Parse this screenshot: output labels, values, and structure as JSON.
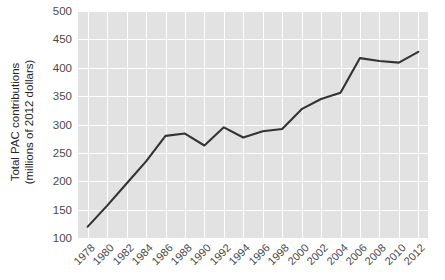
{
  "chart_data": {
    "type": "line",
    "title": "",
    "xlabel": "",
    "ylabel": "Total PAC contributions (millions of 2012 dollars)",
    "ylabel_line1": "Total PAC contributions",
    "ylabel_line2": "(millions of 2012 dollars)",
    "categories": [
      "1978",
      "1980",
      "1982",
      "1984",
      "1986",
      "1988",
      "1990",
      "1992",
      "1994",
      "1996",
      "1998",
      "2000",
      "2002",
      "2004",
      "2006",
      "2008",
      "2010",
      "2012"
    ],
    "x": [
      1978,
      1980,
      1982,
      1984,
      1986,
      1988,
      1990,
      1992,
      1994,
      1996,
      1998,
      2000,
      2002,
      2004,
      2006,
      2008,
      2010,
      2012
    ],
    "values": [
      120,
      157,
      196,
      235,
      280,
      284,
      263,
      295,
      277,
      288,
      292,
      327,
      345,
      356,
      417,
      412,
      409,
      428
    ],
    "series": [
      {
        "name": "Total PAC contributions",
        "values": [
          120,
          157,
          196,
          235,
          280,
          284,
          263,
          295,
          277,
          288,
          292,
          327,
          345,
          356,
          417,
          412,
          409,
          428
        ]
      }
    ],
    "yticks": [
      100,
      150,
      200,
      250,
      300,
      350,
      400,
      450,
      500
    ],
    "ytick_labels": [
      "100",
      "150",
      "200",
      "250",
      "300",
      "350",
      "400",
      "450",
      "500"
    ],
    "xtick_labels": [
      "1978",
      "1980",
      "1982",
      "1984",
      "1986",
      "1988",
      "1990",
      "1992",
      "1994",
      "1996",
      "1998",
      "2000",
      "2002",
      "2004",
      "2006",
      "2008",
      "2010",
      "2012"
    ],
    "xlim": [
      1977,
      2013
    ],
    "ylim": [
      100,
      500
    ],
    "grid": true,
    "legend": "none",
    "line_color": "#333333",
    "plot_background": "#e2e2e2",
    "grid_color": "#ffffff",
    "figure_background": "#ffffff",
    "tick_label_color": "#4a4a4a",
    "axis_label_color": "#262626"
  }
}
